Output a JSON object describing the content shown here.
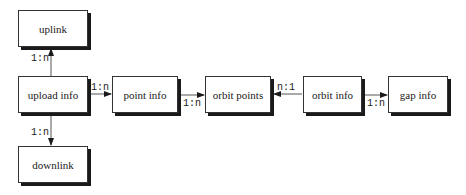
{
  "diagram": {
    "type": "entity-relationship",
    "nodes": [
      {
        "id": "uplink",
        "label": "uplink"
      },
      {
        "id": "upload_info",
        "label": "upload info"
      },
      {
        "id": "downlink",
        "label": "downlink"
      },
      {
        "id": "point_info",
        "label": "point info"
      },
      {
        "id": "orbit_points",
        "label": "orbit points"
      },
      {
        "id": "orbit_info",
        "label": "orbit info"
      },
      {
        "id": "gap_info",
        "label": "gap info"
      }
    ],
    "edges": [
      {
        "from": "upload_info",
        "to": "uplink",
        "cardinality": "1:n"
      },
      {
        "from": "upload_info",
        "to": "downlink",
        "cardinality": "1:n"
      },
      {
        "from": "upload_info",
        "to": "point_info",
        "cardinality": "1:n"
      },
      {
        "from": "point_info",
        "to": "orbit_points",
        "cardinality": "1:n"
      },
      {
        "from": "orbit_info",
        "to": "orbit_points",
        "cardinality": "n:1"
      },
      {
        "from": "orbit_info",
        "to": "gap_info",
        "cardinality": "1:n"
      }
    ]
  },
  "colors": {
    "line": "#333333",
    "shadow": "#1a1a1a",
    "background": "#ffffff"
  }
}
